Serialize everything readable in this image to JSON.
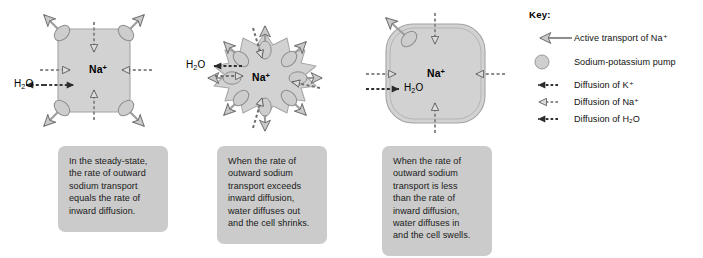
{
  "key": {
    "title": "Key:",
    "entries": [
      {
        "glyph": "active-transport-arrow",
        "label": "Active transport of Na⁺"
      },
      {
        "glyph": "pump-circle",
        "label": "Sodium-potassium pump"
      },
      {
        "glyph": "dotted-solid-arrow",
        "label": "Diffusion of K⁺"
      },
      {
        "glyph": "dotted-hollow-arrow",
        "label": "Diffusion of Na⁺"
      },
      {
        "glyph": "dotted-solid-arrow",
        "label": "Diffusion of H₂O"
      }
    ]
  },
  "cells": [
    {
      "id": "steady-state",
      "state": "normal",
      "ion_label": "Na⁺",
      "water_label": "H₂O",
      "caption": "In the steady-state,\nthe rate of outward\nsodium transport\nequals the rate of\ninward diffusion."
    },
    {
      "id": "shrinking",
      "state": "crenated",
      "ion_label": "Na⁺",
      "water_label": "H₂O",
      "caption": "When the rate of\noutward sodium\ntransport exceeds\ninward diffusion,\nwater diffuses out\nand the cell shrinks."
    },
    {
      "id": "swelling",
      "state": "swollen",
      "ion_label": "Na⁺",
      "water_label": "H₂O",
      "caption": "When the rate of\noutward sodium\ntransport is less\nthan the rate of\ninward diffusion,\nwater diffuses in\nand the cell swells."
    }
  ],
  "colors": {
    "cell_fill": "#d2d2d2",
    "cell_stroke": "#9a9a9a",
    "caption_bg": "#cbcbcb",
    "arrow_gray": "#8e8e8e",
    "arrow_dark": "#3a3a3a",
    "text": "#1a1a1a",
    "background": "#ffffff"
  }
}
